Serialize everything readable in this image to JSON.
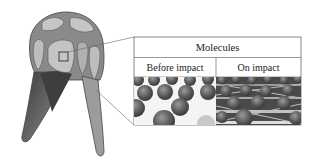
{
  "figure": {
    "callout_table": {
      "title": "Molecules",
      "columns": [
        {
          "label": "Before impact",
          "image": "separated-spherical-molecules"
        },
        {
          "label": "On impact",
          "image": "cross-linked-molecules"
        }
      ]
    },
    "colors": {
      "helmet_dark": "#6e6e6e",
      "helmet_mid": "#9a9a9a",
      "helmet_light": "#c4c4c4",
      "line": "#555555",
      "molecule": "#5a5a5a"
    }
  }
}
